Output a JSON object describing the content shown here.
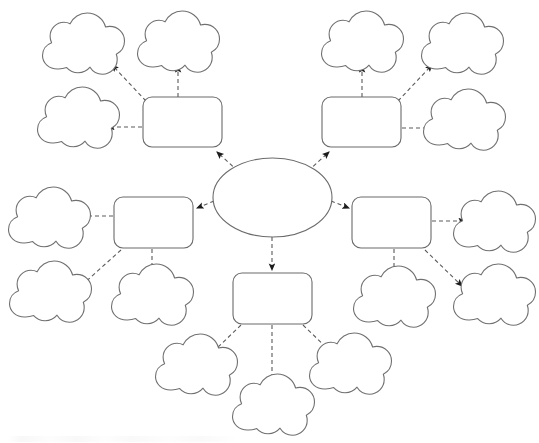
{
  "document": {
    "type": "concept-map",
    "title": "",
    "background_color": "#ffffff",
    "width": 539,
    "height": 443
  },
  "style": {
    "shape_stroke": "#6b6b6b",
    "cloud_stroke": "#707070",
    "connector_stroke": "#5a5a5a",
    "fill": "#ffffff",
    "connector_dash": "4 3"
  },
  "center": {
    "id": "center-topic",
    "label": "",
    "shape": "ellipse",
    "cx": 272.5,
    "cy": 197.5,
    "rx": 59.5,
    "ry": 39.5
  },
  "branches": [
    {
      "id": "branch-top-left",
      "label": "",
      "shape": "rounded-rect",
      "x": 143,
      "y": 97,
      "w": 79,
      "h": 50
    },
    {
      "id": "branch-top-right",
      "label": "",
      "shape": "rounded-rect",
      "x": 322,
      "y": 97,
      "w": 79,
      "h": 50
    },
    {
      "id": "branch-mid-left",
      "label": "",
      "shape": "rounded-rect",
      "x": 114,
      "y": 197,
      "w": 79,
      "h": 50
    },
    {
      "id": "branch-mid-right",
      "label": "",
      "shape": "rounded-rect",
      "x": 352,
      "y": 197,
      "w": 79,
      "h": 50
    },
    {
      "id": "branch-bottom",
      "label": "",
      "shape": "rounded-rect",
      "x": 233,
      "y": 273,
      "w": 79,
      "h": 50
    }
  ],
  "leaves": [
    {
      "id": "cloud-tl-upper-left",
      "label": "",
      "cx": 83,
      "cy": 44,
      "scale": 1.0,
      "parent": "branch-top-left"
    },
    {
      "id": "cloud-tl-upper-right",
      "label": "",
      "cx": 178,
      "cy": 42,
      "scale": 1.0,
      "parent": "branch-top-left"
    },
    {
      "id": "cloud-tl-left",
      "label": "",
      "cx": 78,
      "cy": 118,
      "scale": 1.0,
      "parent": "branch-top-left"
    },
    {
      "id": "cloud-tr-upper-left",
      "label": "",
      "cx": 362,
      "cy": 42,
      "scale": 1.0,
      "parent": "branch-top-right"
    },
    {
      "id": "cloud-tr-upper-right",
      "label": "",
      "cx": 462,
      "cy": 44,
      "scale": 1.0,
      "parent": "branch-top-right"
    },
    {
      "id": "cloud-tr-right",
      "label": "",
      "cx": 464,
      "cy": 120,
      "scale": 1.0,
      "parent": "branch-top-right"
    },
    {
      "id": "cloud-ml-left",
      "label": "",
      "cx": 49,
      "cy": 218,
      "scale": 1.0,
      "parent": "branch-mid-left"
    },
    {
      "id": "cloud-ml-lower-left",
      "label": "",
      "cx": 50,
      "cy": 292,
      "scale": 1.0,
      "parent": "branch-mid-left"
    },
    {
      "id": "cloud-ml-lower",
      "label": "",
      "cx": 152,
      "cy": 295,
      "scale": 1.0,
      "parent": "branch-mid-left"
    },
    {
      "id": "cloud-mr-right",
      "label": "",
      "cx": 494,
      "cy": 222,
      "scale": 1.0,
      "parent": "branch-mid-right"
    },
    {
      "id": "cloud-mr-lower",
      "label": "",
      "cx": 394,
      "cy": 297,
      "scale": 1.0,
      "parent": "branch-mid-right"
    },
    {
      "id": "cloud-mr-lower-right",
      "label": "",
      "cx": 494,
      "cy": 295,
      "scale": 1.0,
      "parent": "branch-mid-right"
    },
    {
      "id": "cloud-bot-left",
      "label": "",
      "cx": 196,
      "cy": 365,
      "scale": 1.0,
      "parent": "branch-bottom"
    },
    {
      "id": "cloud-bot-center",
      "label": "",
      "cx": 273,
      "cy": 405,
      "scale": 1.0,
      "parent": "branch-bottom"
    },
    {
      "id": "cloud-bot-right",
      "label": "",
      "cx": 350,
      "cy": 364,
      "scale": 1.0,
      "parent": "branch-bottom"
    }
  ],
  "connectors": [
    {
      "id": "conn-center-to-top-left",
      "from": "center-topic",
      "to": "branch-top-left",
      "x1": 238,
      "y1": 171,
      "x2": 215,
      "y2": 150
    },
    {
      "id": "conn-center-to-top-right",
      "from": "center-topic",
      "to": "branch-top-right",
      "x1": 308,
      "y1": 171,
      "x2": 330,
      "y2": 150
    },
    {
      "id": "conn-center-to-mid-left",
      "from": "center-topic",
      "to": "branch-mid-left",
      "x1": 213,
      "y1": 202,
      "x2": 196,
      "y2": 209
    },
    {
      "id": "conn-center-to-mid-right",
      "from": "center-topic",
      "to": "branch-mid-right",
      "x1": 332,
      "y1": 202,
      "x2": 350,
      "y2": 209
    },
    {
      "id": "conn-center-to-bottom",
      "from": "center-topic",
      "to": "branch-bottom",
      "x1": 272,
      "y1": 237,
      "x2": 272,
      "y2": 271
    },
    {
      "id": "conn-tl-to-upper-left",
      "from": "branch-top-left",
      "to": "cloud-tl-upper-left",
      "x1": 148,
      "y1": 99,
      "x2": 111,
      "y2": 63
    },
    {
      "id": "conn-tl-to-upper-right",
      "from": "branch-top-left",
      "to": "cloud-tl-upper-right",
      "x1": 178,
      "y1": 96,
      "x2": 178,
      "y2": 64
    },
    {
      "id": "conn-tl-to-left",
      "from": "branch-top-left",
      "to": "cloud-tl-left",
      "x1": 141,
      "y1": 127,
      "x2": 106,
      "y2": 127
    },
    {
      "id": "conn-tr-to-upper-left",
      "from": "branch-top-right",
      "to": "cloud-tr-upper-left",
      "x1": 362,
      "y1": 96,
      "x2": 362,
      "y2": 64
    },
    {
      "id": "conn-tr-to-upper-right",
      "from": "branch-top-right",
      "to": "cloud-tr-upper-right",
      "x1": 398,
      "y1": 99,
      "x2": 434,
      "y2": 63
    },
    {
      "id": "conn-tr-to-right",
      "from": "branch-top-right",
      "to": "cloud-tr-right",
      "x1": 403,
      "y1": 128,
      "x2": 437,
      "y2": 128
    },
    {
      "id": "conn-ml-to-left",
      "from": "branch-mid-left",
      "to": "cloud-ml-left",
      "x1": 112,
      "y1": 216,
      "x2": 77,
      "y2": 216
    },
    {
      "id": "conn-ml-to-lower-left",
      "from": "branch-mid-left",
      "to": "cloud-ml-lower-left",
      "x1": 120,
      "y1": 249,
      "x2": 80,
      "y2": 283
    },
    {
      "id": "conn-ml-to-lower",
      "from": "branch-mid-left",
      "to": "cloud-ml-lower",
      "x1": 152,
      "y1": 249,
      "x2": 152,
      "y2": 283
    },
    {
      "id": "conn-mr-to-right",
      "from": "branch-mid-right",
      "to": "cloud-mr-right",
      "x1": 433,
      "y1": 221,
      "x2": 467,
      "y2": 221
    },
    {
      "id": "conn-mr-to-lower",
      "from": "branch-mid-right",
      "to": "cloud-mr-lower",
      "x1": 394,
      "y1": 249,
      "x2": 394,
      "y2": 284
    },
    {
      "id": "conn-mr-to-lower-right",
      "from": "branch-mid-right",
      "to": "cloud-mr-lower-right",
      "x1": 426,
      "y1": 249,
      "x2": 464,
      "y2": 285
    },
    {
      "id": "conn-bot-to-left",
      "from": "branch-bottom",
      "to": "cloud-bot-left",
      "x1": 240,
      "y1": 324,
      "x2": 210,
      "y2": 352
    },
    {
      "id": "conn-bot-to-center",
      "from": "branch-bottom",
      "to": "cloud-bot-center",
      "x1": 272,
      "y1": 324,
      "x2": 272,
      "y2": 390
    },
    {
      "id": "conn-bot-to-right",
      "from": "branch-bottom",
      "to": "cloud-bot-right",
      "x1": 304,
      "y1": 324,
      "x2": 334,
      "y2": 352
    }
  ]
}
